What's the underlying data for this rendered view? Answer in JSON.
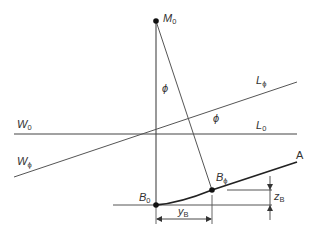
{
  "diagram": {
    "type": "geometric-construction",
    "colors": {
      "line": "#4a4a4a",
      "thick": "#222222",
      "text": "#333333",
      "dot": "#111111"
    },
    "points": {
      "M0": {
        "label": "M",
        "sub": "0",
        "x": 156,
        "y": 21
      },
      "B0": {
        "label": "B",
        "sub": "0",
        "x": 156,
        "y": 205
      },
      "Bphi": {
        "label": "B",
        "sub": "ϕ",
        "x": 212,
        "y": 190
      },
      "A": {
        "label": "A",
        "x": 297,
        "y": 162
      }
    },
    "lines": {
      "W0": {
        "label": "W",
        "sub": "0"
      },
      "L0": {
        "label": "L",
        "sub": "0"
      },
      "Wphi": {
        "label": "W",
        "sub": "ϕ"
      },
      "Lphi": {
        "label": "L",
        "sub": "ϕ"
      }
    },
    "angles": {
      "phi_top": "ϕ",
      "phi_mid": "ϕ"
    },
    "dimensions": {
      "yB": {
        "label": "y",
        "sub": "B"
      },
      "zB": {
        "label": "z",
        "sub": "B"
      }
    }
  }
}
